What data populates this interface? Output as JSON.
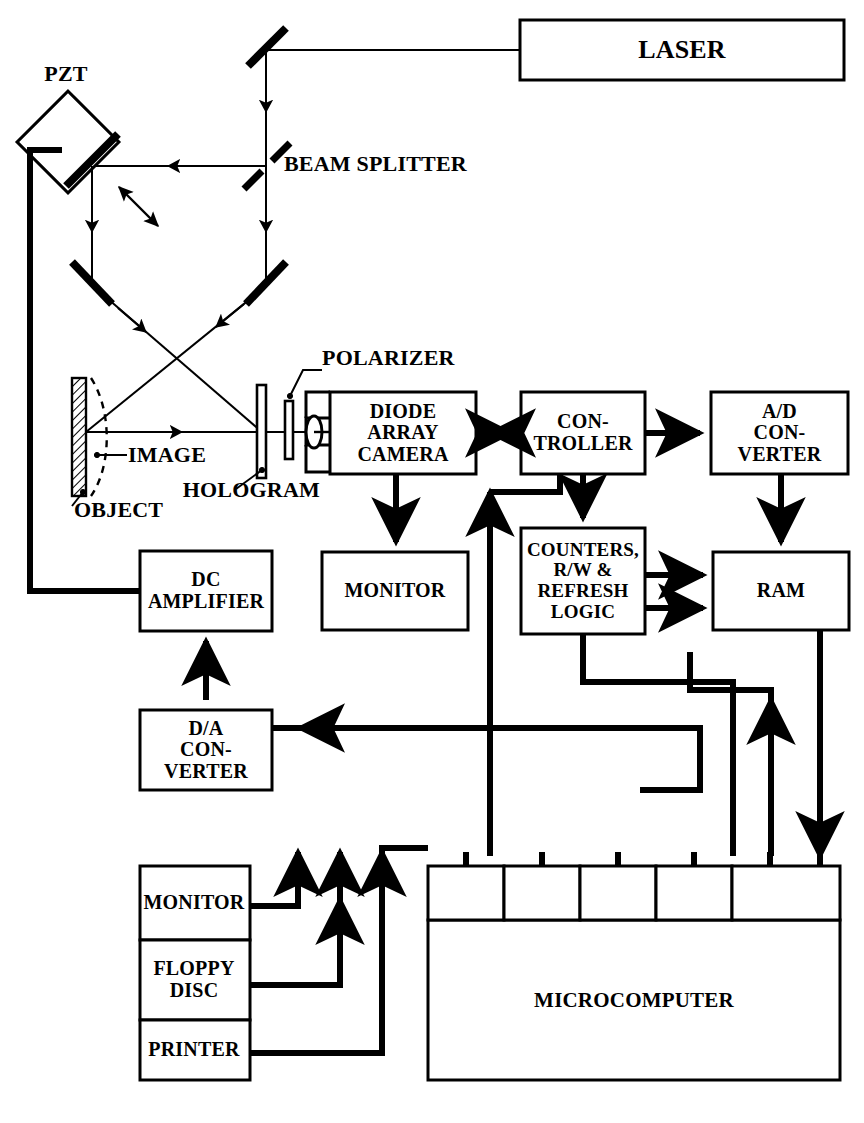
{
  "figure": {
    "type": "optical-electronic block diagram"
  },
  "optics": {
    "laser": {
      "label": "LASER",
      "x": 520,
      "y": 20,
      "w": 324,
      "h": 60
    },
    "pzt": {
      "label": "PZT",
      "label_x": 34,
      "label_y": 74
    },
    "beam_splitter": {
      "label": "BEAM SPLITTER",
      "label_x": 284,
      "label_y": 163
    },
    "polarizer": {
      "label": "POLARIZER",
      "label_x": 307,
      "label_y": 352
    },
    "hologram": {
      "label": "HOLOGRAM",
      "label_x": 222,
      "label_y": 485
    },
    "image": {
      "label": "IMAGE",
      "label_x": 133,
      "label_y": 455
    },
    "object": {
      "label": "OBJECT",
      "label_x": 95,
      "label_y": 495
    }
  },
  "blocks": [
    {
      "id": "diode-array-camera",
      "label": "DIODE\nARRAY\nCAMERA",
      "x": 330,
      "y": 392,
      "w": 146,
      "h": 82,
      "font": 20
    },
    {
      "id": "controller",
      "label": "CON-\nTROLLER",
      "x": 521,
      "y": 392,
      "w": 124,
      "h": 82,
      "font": 20
    },
    {
      "id": "ad-converter",
      "label": "A/D\nCON-\nVERTER",
      "x": 711,
      "y": 392,
      "w": 137,
      "h": 82,
      "font": 20
    },
    {
      "id": "monitor-video",
      "label": "MONITOR",
      "x": 322,
      "y": 552,
      "w": 146,
      "h": 78,
      "font": 20
    },
    {
      "id": "counters-logic",
      "label": "COUNTERS,\nR/W &\nREFRESH\nLOGIC",
      "x": 521,
      "y": 528,
      "w": 124,
      "h": 106,
      "font": 19
    },
    {
      "id": "ram",
      "label": "RAM",
      "x": 713,
      "y": 552,
      "w": 136,
      "h": 78,
      "font": 20
    },
    {
      "id": "dc-amplifier",
      "label": "DC\nAMPLIFIER",
      "x": 140,
      "y": 551,
      "w": 132,
      "h": 80,
      "font": 20
    },
    {
      "id": "da-converter",
      "label": "D/A\nCON-\nVERTER",
      "x": 140,
      "y": 710,
      "w": 132,
      "h": 80,
      "font": 20
    },
    {
      "id": "microcomputer",
      "label": "MICROCOMPUTER",
      "x": 428,
      "y": 866,
      "w": 412,
      "h": 214,
      "font": 21
    }
  ],
  "peripherals": {
    "x": 140,
    "w": 110,
    "items": [
      {
        "id": "peripheral-monitor",
        "label": "MONITOR",
        "y": 866,
        "h": 74
      },
      {
        "id": "peripheral-floppy-disc",
        "label": "FLOPPY\nDISC",
        "y": 940,
        "h": 80
      },
      {
        "id": "peripheral-printer",
        "label": "PRINTER",
        "y": 1020,
        "h": 60
      }
    ]
  },
  "microcomputer_ports": [
    {
      "id": "port-1",
      "x": 428,
      "w": 76
    },
    {
      "id": "port-2",
      "x": 504,
      "w": 76
    },
    {
      "id": "port-3",
      "x": 580,
      "w": 76
    },
    {
      "id": "port-4",
      "x": 656,
      "w": 76
    },
    {
      "id": "port-5",
      "x": 732,
      "w": 76
    }
  ],
  "colors": {
    "ink": "#000000",
    "paper": "#ffffff"
  }
}
